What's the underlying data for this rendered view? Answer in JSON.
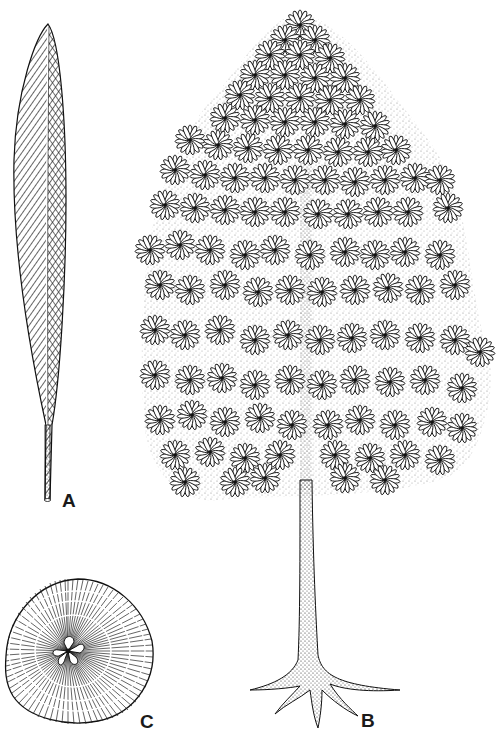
{
  "figure": {
    "panels": [
      {
        "id": "A",
        "label": "A",
        "subject": "single elongated lanceolate leaf with midrib and dense oblique venation, long petiole"
      },
      {
        "id": "B",
        "label": "B",
        "subject": "whole tree habit: columnar crown of radiating leaf rosettes, stippled straight trunk, flared buttress roots"
      },
      {
        "id": "C",
        "label": "C",
        "subject": "stem cross-section with radial rays, growth rings and five-lobed central pith"
      }
    ]
  },
  "colors": {
    "background": "#ffffff",
    "ink": "#1a1a1a"
  }
}
